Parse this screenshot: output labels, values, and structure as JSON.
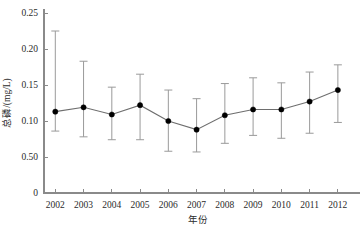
{
  "chart_data": {
    "type": "line",
    "title": "",
    "subtitle": "",
    "xlabel": "年份",
    "ylabel": "总磷/(mg/L)",
    "categories": [
      "2002",
      "2003",
      "2004",
      "2005",
      "2006",
      "2007",
      "2008",
      "2009",
      "2010",
      "2011",
      "2012"
    ],
    "x": [
      2002,
      2003,
      2004,
      2005,
      2006,
      2007,
      2008,
      2009,
      2010,
      2011,
      2012
    ],
    "values": [
      0.113,
      0.119,
      0.109,
      0.122,
      0.1,
      0.088,
      0.108,
      0.116,
      0.116,
      0.127,
      0.143
    ],
    "error_upper": [
      0.225,
      0.183,
      0.147,
      0.165,
      0.143,
      0.131,
      0.152,
      0.16,
      0.153,
      0.168,
      0.178
    ],
    "error_lower": [
      0.086,
      0.078,
      0.074,
      0.074,
      0.058,
      0.057,
      0.069,
      0.08,
      0.076,
      0.083,
      0.098
    ],
    "ylim": [
      0,
      0.25
    ],
    "xlim": [
      2001.6,
      2012.5
    ],
    "ytick_values": [
      0,
      0.05,
      0.1,
      0.15,
      0.2,
      0.25
    ],
    "ytick_labels": [
      "0",
      "0.50",
      "0.10",
      "0.15",
      "0.20",
      "0.25"
    ],
    "grid": false,
    "legend": null,
    "legend_position": "none",
    "marker": "filled-circle",
    "error_bar_style": "capped-vertical",
    "series": [
      {
        "name": "总磷",
        "values": [
          0.113,
          0.119,
          0.109,
          0.122,
          0.1,
          0.088,
          0.108,
          0.116,
          0.116,
          0.127,
          0.143
        ]
      }
    ],
    "annotations": []
  },
  "colors": {
    "marker": "#000000",
    "line": "#6e6e6e",
    "error_bar": "#9a9a9a",
    "axis": "#8a8a8a",
    "text": "#2b2b2b",
    "background": "#ffffff"
  }
}
